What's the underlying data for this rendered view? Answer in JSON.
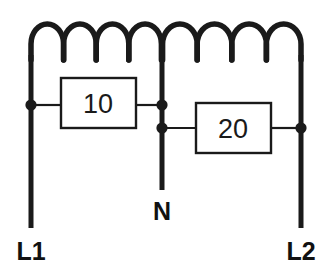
{
  "diagram": {
    "type": "electrical-circuit-schematic",
    "title": "",
    "colors": {
      "line": "#1a1a1a",
      "background": "#ffffff",
      "box_fill": "#ffffff"
    },
    "components": [
      {
        "id": "resistor-10",
        "kind": "box-resistor",
        "label": "10",
        "x": 60,
        "y": 78,
        "width": 76,
        "height": 50
      },
      {
        "id": "resistor-20",
        "kind": "box-resistor",
        "label": "20",
        "x": 196,
        "y": 103,
        "width": 75,
        "height": 50
      }
    ],
    "coil": {
      "kind": "inductor-winding",
      "arches_left": 4,
      "arches_right": 4,
      "arch_count_total": 8,
      "top_y": 24,
      "valley_y": 58,
      "start_x": 31,
      "end_x": 301
    },
    "nodes": [
      {
        "id": "node-left",
        "x": 31,
        "y": 105
      },
      {
        "id": "node-center-upper",
        "x": 162,
        "y": 105
      },
      {
        "id": "node-center-lower",
        "x": 162,
        "y": 128
      },
      {
        "id": "node-right",
        "x": 301,
        "y": 128
      }
    ],
    "terminals": [
      {
        "id": "terminal-l1",
        "label": "L1",
        "x": 31,
        "y": 251,
        "line_bottom": 228
      },
      {
        "id": "terminal-n",
        "label": "N",
        "x": 162,
        "y": 211,
        "line_bottom": 190
      },
      {
        "id": "terminal-l2",
        "label": "L2",
        "x": 301,
        "y": 251,
        "line_bottom": 228
      }
    ]
  }
}
